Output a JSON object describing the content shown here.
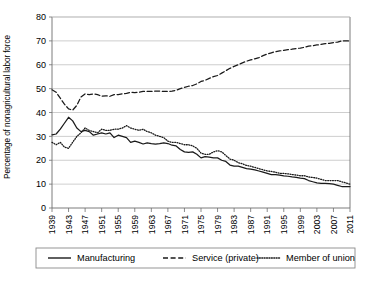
{
  "chart_data": {
    "type": "line",
    "title": "",
    "xlabel": "",
    "ylabel": "Percentage of nonagricultural labor force",
    "ylim": [
      0,
      80
    ],
    "ytick_values": [
      0,
      10,
      20,
      30,
      40,
      50,
      60,
      70,
      80
    ],
    "ytick_labels": [
      "0",
      "10",
      "20",
      "30",
      "40",
      "50",
      "60",
      "70",
      "80"
    ],
    "xlim": [
      1939,
      2011
    ],
    "xtick_values": [
      1939,
      1943,
      1947,
      1951,
      1955,
      1959,
      1963,
      1967,
      1971,
      1975,
      1979,
      1983,
      1987,
      1991,
      1995,
      1999,
      2003,
      2007,
      2011
    ],
    "xtick_labels": [
      "1939",
      "1943",
      "1947",
      "1951",
      "1955",
      "1959",
      "1963",
      "1967",
      "1971",
      "1975",
      "1979",
      "1983",
      "1987",
      "1991",
      "1995",
      "1999",
      "2003",
      "2007",
      "2011"
    ],
    "grid": "horizontal",
    "legend_position": "bottom",
    "x": [
      1939,
      1940,
      1941,
      1942,
      1943,
      1944,
      1945,
      1946,
      1947,
      1948,
      1949,
      1950,
      1951,
      1952,
      1953,
      1954,
      1955,
      1956,
      1957,
      1958,
      1959,
      1960,
      1961,
      1962,
      1963,
      1964,
      1965,
      1966,
      1967,
      1968,
      1969,
      1970,
      1971,
      1972,
      1973,
      1974,
      1975,
      1976,
      1977,
      1978,
      1979,
      1980,
      1981,
      1982,
      1983,
      1984,
      1985,
      1986,
      1987,
      1988,
      1989,
      1990,
      1991,
      1992,
      1993,
      1994,
      1995,
      1996,
      1997,
      1998,
      1999,
      2000,
      2001,
      2002,
      2003,
      2004,
      2005,
      2006,
      2007,
      2008,
      2009,
      2010,
      2011
    ],
    "series": [
      {
        "name": "Manufacturing",
        "style": "solid",
        "color": "#1a1a1a",
        "values": [
          30.6,
          31.0,
          33.0,
          35.5,
          38.0,
          36.5,
          33.5,
          32.0,
          32.5,
          32.0,
          30.5,
          31.0,
          31.5,
          31.0,
          31.5,
          29.5,
          30.5,
          30.0,
          29.5,
          27.5,
          28.0,
          27.5,
          26.8,
          27.3,
          27.0,
          26.8,
          27.0,
          27.3,
          27.0,
          26.3,
          26.0,
          24.5,
          23.5,
          23.3,
          23.5,
          22.5,
          21.0,
          21.5,
          21.3,
          21.0,
          21.0,
          20.0,
          19.5,
          18.0,
          17.5,
          17.5,
          17.0,
          16.5,
          16.3,
          16.0,
          15.5,
          15.0,
          14.5,
          14.0,
          14.0,
          13.8,
          13.5,
          13.3,
          13.0,
          12.8,
          12.5,
          12.3,
          11.5,
          11.0,
          10.5,
          10.3,
          10.3,
          10.2,
          10.0,
          9.5,
          9.0,
          9.0,
          9.0
        ]
      },
      {
        "name": "Service (private)",
        "style": "dashed",
        "color": "#1a1a1a",
        "values": [
          49.5,
          48.5,
          46.0,
          43.5,
          41.5,
          41.0,
          43.0,
          46.5,
          47.8,
          47.5,
          47.8,
          47.5,
          46.8,
          47.0,
          46.8,
          47.5,
          47.5,
          47.8,
          48.0,
          48.5,
          48.3,
          48.5,
          48.8,
          48.8,
          48.8,
          49.0,
          49.0,
          48.8,
          48.8,
          49.0,
          49.3,
          50.0,
          50.5,
          51.0,
          51.3,
          52.0,
          53.0,
          53.5,
          54.3,
          55.0,
          55.5,
          56.5,
          57.5,
          58.5,
          59.3,
          60.0,
          60.8,
          61.5,
          62.0,
          62.5,
          63.0,
          63.8,
          64.5,
          65.0,
          65.5,
          65.8,
          66.0,
          66.3,
          66.5,
          66.8,
          67.0,
          67.3,
          67.8,
          68.0,
          68.3,
          68.5,
          68.8,
          69.0,
          69.3,
          69.5,
          70.0,
          70.0,
          70.0
        ]
      },
      {
        "name": "Member of union",
        "style": "dotted",
        "color": "#1a1a1a",
        "values": [
          27.5,
          26.5,
          27.5,
          25.5,
          25.0,
          27.5,
          30.0,
          31.5,
          33.5,
          32.5,
          32.0,
          31.5,
          33.0,
          32.5,
          32.5,
          33.0,
          33.0,
          33.5,
          34.5,
          33.5,
          33.0,
          32.5,
          33.0,
          32.0,
          31.5,
          30.5,
          30.0,
          29.5,
          28.0,
          27.5,
          27.5,
          27.0,
          26.5,
          26.5,
          26.0,
          25.0,
          23.0,
          22.5,
          22.5,
          23.5,
          24.0,
          23.5,
          22.0,
          20.5,
          20.0,
          19.0,
          18.5,
          17.8,
          17.5,
          17.0,
          16.5,
          16.0,
          15.5,
          15.3,
          15.0,
          14.5,
          14.5,
          14.3,
          14.0,
          13.8,
          13.5,
          13.5,
          13.0,
          12.8,
          12.5,
          12.0,
          11.5,
          11.5,
          11.5,
          11.5,
          11.0,
          10.5,
          10.0
        ]
      }
    ]
  },
  "legend": {
    "items": [
      {
        "label": "Manufacturing",
        "style": "solid"
      },
      {
        "label": "Service (private)",
        "style": "dashed"
      },
      {
        "label": "Member of union",
        "style": "dotted"
      }
    ]
  }
}
